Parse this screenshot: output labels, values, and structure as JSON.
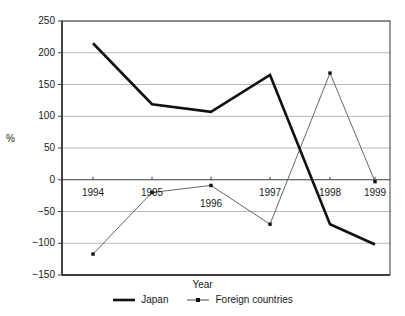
{
  "chart_data": {
    "type": "line",
    "title": "",
    "xlabel": "Year",
    "ylabel": "%",
    "categories": [
      "1994",
      "1995",
      "1996",
      "1997",
      "1998",
      "1999"
    ],
    "x": [
      1994,
      1995,
      1996,
      1997,
      1998,
      1999
    ],
    "ylim": [
      -150,
      250
    ],
    "yticks": [
      250,
      200,
      150,
      100,
      50,
      0,
      -50,
      -100,
      -150
    ],
    "ytick_labels": [
      "250",
      "200",
      "150",
      "100",
      "50",
      "0",
      "−50",
      "−100",
      "−150"
    ],
    "grid": true,
    "legend_position": "bottom",
    "series": [
      {
        "name": "Japan",
        "values": [
          215,
          119,
          107,
          165,
          -70,
          -102
        ],
        "color": "#111111",
        "line_width": 2.6,
        "marker": "none"
      },
      {
        "name": "Foreign countries",
        "values": [
          -117,
          -20,
          -9,
          -70,
          168,
          -3
        ],
        "color": "#555555",
        "line_width": 0.9,
        "marker": "square-dot"
      }
    ]
  },
  "axes": {
    "y_label": "%",
    "x_label": "Year"
  },
  "legend": {
    "items": [
      {
        "label": "Japan",
        "icon": "thick-line-swatch"
      },
      {
        "label": "Foreign countries",
        "icon": "thin-line-dot-swatch"
      }
    ]
  },
  "plot_geometry": {
    "left": 62,
    "right": 390,
    "top": 21,
    "bottom": 275,
    "x_positions": [
      93,
      152,
      211,
      270,
      330,
      375
    ],
    "x_label_y": [
      188,
      188,
      199,
      188,
      188,
      188
    ]
  },
  "colors": {
    "axis": "#3d3d3d",
    "grid": "#b8b8b8",
    "japan": "#111111",
    "foreign": "#555555",
    "background": "#ffffff",
    "text": "#1a1a1a"
  }
}
